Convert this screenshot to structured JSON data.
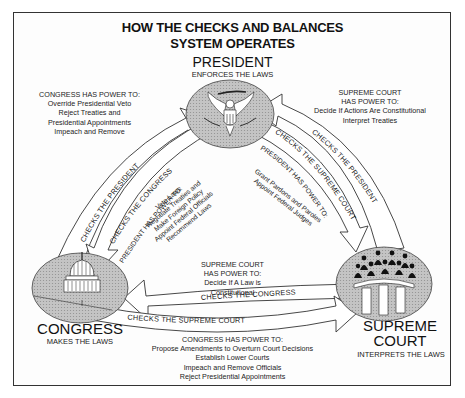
{
  "title": {
    "line1": "HOW THE CHECKS AND BALANCES",
    "line2": "SYSTEM OPERATES"
  },
  "branches": {
    "president": {
      "name": "PRESIDENT",
      "role": "ENFORCES THE LAWS",
      "icon": "presidential-seal-eagle"
    },
    "congress": {
      "name": "CONGRESS",
      "role": "MAKES THE LAWS",
      "icon": "capitol-dome"
    },
    "court": {
      "name_line1": "SUPREME",
      "name_line2": "COURT",
      "role": "INTERPRETS THE LAWS",
      "icon": "justices-bench"
    }
  },
  "powers": {
    "congress_over_president": {
      "header": "CONGRESS HAS POWER TO:",
      "items": [
        "Override Presidential Veto",
        "Reject Treaties and",
        "Presidential Appointments",
        "Impeach and Remove"
      ]
    },
    "court_over_president": {
      "header1": "SUPREME COURT",
      "header2": "HAS POWER TO:",
      "items": [
        "Decide If Actions Are Constitutional",
        "Interpret Treaties"
      ]
    },
    "president_over_congress": {
      "header": "PRESIDENT HAS POWER TO:",
      "items": [
        "Veto Laws",
        "Negotiate Treaties and",
        "Make Foreign Policy",
        "Appoint Federal Officials",
        "Recommend Laws"
      ]
    },
    "president_over_court": {
      "header": "PRESIDENT HAS POWER TO:",
      "items": [
        "Grant Pardons and Paroles",
        "Appoint Federal Judges"
      ]
    },
    "court_over_congress": {
      "header1": "SUPREME COURT",
      "header2": "HAS POWER TO:",
      "items": [
        "Decide If A Law is",
        "Constitutional"
      ]
    },
    "congress_over_court": {
      "header": "CONGRESS HAS POWER TO:",
      "items": [
        "Propose Amendments to Overturn Court Decisions",
        "Establish Lower Courts",
        "Impeach and Remove Officials",
        "Reject Presidential Appointments"
      ]
    }
  },
  "arrows": {
    "congress_to_president": "CHECKS THE PRESIDENT",
    "president_to_congress": "CHECKS THE CONGRESS",
    "president_to_court": "CHECKS THE SUPREME COURT",
    "court_to_president": "CHECKS THE PRESIDENT",
    "court_to_congress": "CHECKS THE CONGRESS",
    "congress_to_court": "CHECKS THE SUPREME COURT"
  },
  "colors": {
    "circle_fill": "#b9b9b9",
    "line": "#333333",
    "background": "#ffffff"
  }
}
